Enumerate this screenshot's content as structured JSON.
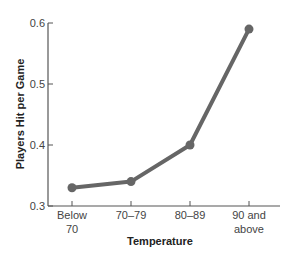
{
  "chart_data": {
    "type": "line",
    "title": "",
    "xlabel": "Temperature",
    "ylabel": "Players Hit per Game",
    "categories": [
      "Below 70",
      "70–79",
      "80–89",
      "90 and above"
    ],
    "category_lines": [
      [
        "Below",
        "70"
      ],
      [
        "70–79"
      ],
      [
        "80–89"
      ],
      [
        "90 and",
        "above"
      ]
    ],
    "values": [
      0.33,
      0.34,
      0.4,
      0.59
    ],
    "ylim": [
      0.3,
      0.6
    ],
    "yticks": [
      0.3,
      0.4,
      0.5,
      0.6
    ],
    "ytick_labels": [
      "0.3",
      "0.4",
      "0.5",
      "0.6"
    ],
    "grid": false,
    "legend": null,
    "line_color": "#666666"
  }
}
